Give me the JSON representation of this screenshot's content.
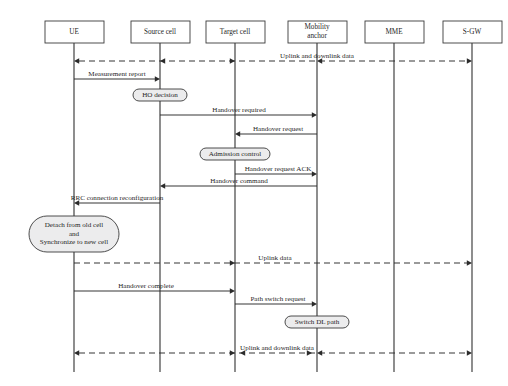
{
  "diagram": {
    "type": "sequence-diagram",
    "width": 508,
    "height": 386,
    "colors": {
      "line": "#2b2b2b",
      "box_fill": "#ffffff",
      "activity_fill": "#ececed",
      "text": "#1f1f1f",
      "caption": "#cfcfcf"
    }
  },
  "lanes": [
    {
      "id": "ue",
      "label": "UE",
      "label2": "",
      "x": 74,
      "box_x": 45,
      "box_w": 59,
      "box_y": 21,
      "box_h": 22
    },
    {
      "id": "source",
      "label": "Source cell",
      "label2": "",
      "x": 160,
      "box_x": 131,
      "box_w": 59,
      "box_y": 21,
      "box_h": 22
    },
    {
      "id": "target",
      "label": "Target cell",
      "label2": "",
      "x": 235,
      "box_x": 206,
      "box_w": 59,
      "box_y": 21,
      "box_h": 22
    },
    {
      "id": "mobility",
      "label": "Mobility",
      "label2": "anchor",
      "x": 317,
      "box_x": 288,
      "box_w": 59,
      "box_y": 21,
      "box_h": 22
    },
    {
      "id": "mme",
      "label": "MME",
      "label2": "",
      "x": 394,
      "box_x": 365,
      "box_w": 59,
      "box_y": 21,
      "box_h": 22
    },
    {
      "id": "sgw",
      "label": "S-GW",
      "label2": "",
      "x": 472,
      "box_x": 443,
      "box_w": 59,
      "box_y": 21,
      "box_h": 22
    }
  ],
  "messages": [
    {
      "id": "m1",
      "label": "Uplink and downlink data",
      "style": "dashed",
      "y": 61,
      "x1": 74,
      "x2": 472,
      "arrow_start": true,
      "arrow_end": true,
      "mid_arrows": [
        {
          "x": 160,
          "dir": "left"
        },
        {
          "x": 235,
          "dir": "right"
        },
        {
          "x": 317,
          "dir": "left"
        }
      ],
      "label_x": 317,
      "label_y": 58,
      "label_anchor": "middle"
    },
    {
      "id": "m2",
      "label": "Measurement report",
      "style": "solid",
      "y": 79,
      "x1": 74,
      "x2": 160,
      "arrow_start": false,
      "arrow_end": true,
      "mid_arrows": [],
      "label_x": 117,
      "label_y": 76,
      "label_anchor": "middle"
    },
    {
      "id": "m3",
      "label": "Handover required",
      "style": "solid",
      "y": 115,
      "x1": 160,
      "x2": 317,
      "arrow_start": false,
      "arrow_end": true,
      "mid_arrows": [],
      "label_x": 239,
      "label_y": 112,
      "label_anchor": "middle"
    },
    {
      "id": "m4",
      "label": "Handover request",
      "style": "solid",
      "y": 134,
      "x1": 317,
      "x2": 235,
      "arrow_start": false,
      "arrow_end": true,
      "mid_arrows": [],
      "label_x": 278,
      "label_y": 131,
      "label_anchor": "middle"
    },
    {
      "id": "m5",
      "label": "Handover request ACK",
      "style": "solid",
      "y": 174,
      "x1": 235,
      "x2": 317,
      "arrow_start": false,
      "arrow_end": true,
      "mid_arrows": [],
      "label_x": 278,
      "label_y": 171,
      "label_anchor": "middle"
    },
    {
      "id": "m6",
      "label": "Handover command",
      "style": "solid",
      "y": 186,
      "x1": 317,
      "x2": 160,
      "arrow_start": false,
      "arrow_end": true,
      "mid_arrows": [],
      "label_x": 239,
      "label_y": 183,
      "label_anchor": "middle"
    },
    {
      "id": "m7",
      "label": "RRC connection reconfiguration",
      "style": "solid",
      "y": 203,
      "x1": 160,
      "x2": 74,
      "arrow_start": false,
      "arrow_end": true,
      "mid_arrows": [],
      "label_x": 117,
      "label_y": 200,
      "label_anchor": "middle"
    },
    {
      "id": "m8",
      "label": "Uplink data",
      "style": "dashed",
      "y": 263,
      "x1": 74,
      "x2": 472,
      "arrow_start": false,
      "arrow_end": true,
      "mid_arrows": [
        {
          "x": 235,
          "dir": "right"
        }
      ],
      "label_x": 275,
      "label_y": 260,
      "label_anchor": "middle"
    },
    {
      "id": "m9",
      "label": "Handover complete",
      "style": "solid",
      "y": 291,
      "x1": 74,
      "x2": 235,
      "arrow_start": false,
      "arrow_end": true,
      "mid_arrows": [],
      "label_x": 146,
      "label_y": 288,
      "label_anchor": "middle"
    },
    {
      "id": "m10",
      "label": "Path switch request",
      "style": "solid",
      "y": 304,
      "x1": 235,
      "x2": 317,
      "arrow_start": false,
      "arrow_end": true,
      "mid_arrows": [],
      "label_x": 278,
      "label_y": 301,
      "label_anchor": "middle"
    },
    {
      "id": "m11",
      "label": "Uplink and downlink data",
      "style": "dashed",
      "y": 353,
      "x1": 74,
      "x2": 472,
      "arrow_start": true,
      "arrow_end": true,
      "mid_arrows": [
        {
          "x": 235,
          "dir": "right"
        },
        {
          "x": 240,
          "dir": "left"
        },
        {
          "x": 312,
          "dir": "right"
        },
        {
          "x": 317,
          "dir": "left"
        }
      ],
      "label_x": 277,
      "label_y": 350,
      "label_anchor": "middle"
    }
  ],
  "activities": [
    {
      "id": "a1",
      "label": "HO decision",
      "label2": "",
      "label3": "",
      "cx": 160,
      "cy": 95,
      "w": 54,
      "h": 12
    },
    {
      "id": "a2",
      "label": "Admission control",
      "label2": "",
      "label3": "",
      "cx": 235,
      "cy": 154,
      "w": 70,
      "h": 12
    },
    {
      "id": "a3",
      "label": "Detach from old cell",
      "label2": "and",
      "label3": "Synchronize to new cell",
      "cx": 74,
      "cy": 234,
      "w": 90,
      "h": 36
    },
    {
      "id": "a4",
      "label": "Switch DL path",
      "label2": "",
      "label3": "",
      "cx": 317,
      "cy": 322,
      "w": 64,
      "h": 12
    }
  ],
  "caption": {
    "text": "",
    "x": 254,
    "y": 381
  }
}
